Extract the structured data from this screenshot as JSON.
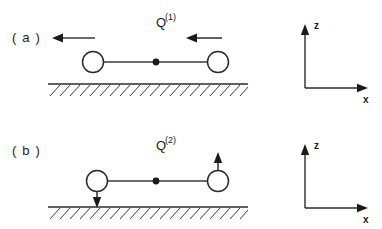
{
  "figure": {
    "background_color": "#ffffff",
    "ink_color": "#2b2b2b"
  },
  "panels": [
    {
      "id": "a",
      "label": "( a )",
      "mode": {
        "symbol": "Q",
        "superscript": "(1)",
        "full": "Q(1)",
        "type": "horizontal-translation"
      },
      "masses": [
        {
          "position": "left",
          "cx": 93,
          "cy": 62,
          "r": 10.5
        },
        {
          "position": "right",
          "cx": 218,
          "cy": 62,
          "r": 10.5
        }
      ],
      "bar": {
        "x1": 103,
        "y1": 62,
        "x2": 208,
        "y2": 62
      },
      "center_dot": {
        "cx": 156,
        "cy": 62,
        "r": 3.4
      },
      "arrows": [
        {
          "name": "left-mass-arrow",
          "direction": "left",
          "x_from": 95,
          "x_to": 52,
          "y": 38
        },
        {
          "name": "right-mass-arrow",
          "direction": "left",
          "x_from": 222,
          "x_to": 186,
          "y": 38
        }
      ],
      "ground": {
        "x1": 48,
        "x2": 248,
        "y": 84
      }
    },
    {
      "id": "b",
      "label": "( b )",
      "mode": {
        "symbol": "Q",
        "superscript": "(2)",
        "full": "Q(2)",
        "type": "vertical-rocking"
      },
      "masses": [
        {
          "position": "left",
          "cx": 97,
          "cy": 181,
          "r": 10.5
        },
        {
          "position": "right",
          "cx": 218,
          "cy": 181,
          "r": 10.5
        }
      ],
      "bar": {
        "x1": 107,
        "y1": 181,
        "x2": 208,
        "y2": 181
      },
      "center_dot": {
        "cx": 156,
        "cy": 181,
        "r": 3.4
      },
      "arrows": [
        {
          "name": "left-mass-arrow",
          "direction": "down",
          "x": 97,
          "y_from": 192,
          "y_to": 208
        },
        {
          "name": "right-mass-arrow",
          "direction": "up",
          "x": 218,
          "y_from": 170,
          "y_to": 152
        }
      ],
      "ground": {
        "x1": 48,
        "x2": 248,
        "y": 207
      }
    }
  ],
  "axes": [
    {
      "id": "axes-top",
      "origin": {
        "x": 305,
        "y": 88
      },
      "vertical": {
        "label": "z",
        "length": 62,
        "label_x": 315,
        "label_y": 28
      },
      "horizontal": {
        "label": "x",
        "length": 62,
        "label_x": 368,
        "label_y": 103
      }
    },
    {
      "id": "axes-bottom",
      "origin": {
        "x": 305,
        "y": 208
      },
      "vertical": {
        "label": "z",
        "length": 62,
        "label_x": 315,
        "label_y": 148
      },
      "horizontal": {
        "label": "x",
        "length": 62,
        "label_x": 368,
        "label_y": 223
      }
    }
  ]
}
